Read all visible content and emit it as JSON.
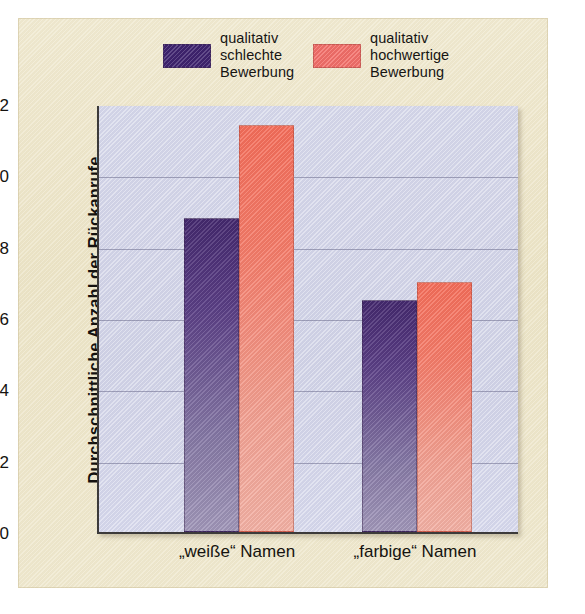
{
  "chart_data": {
    "type": "bar",
    "title": "",
    "xlabel": "",
    "ylabel": "Durchschnittliche Anzahl der Rückanrufe",
    "categories": [
      "„weiße“ Namen",
      "„farbige“ Namen"
    ],
    "series": [
      {
        "name": "qualitativ\nschlechte\nBewerbung",
        "color": "#4b3079",
        "values": [
          8.8,
          6.5
        ]
      },
      {
        "name": "qualitativ\nhochwertige\nBewerbung",
        "color": "#f4705c",
        "values": [
          11.4,
          7.0
        ]
      }
    ],
    "ylim": [
      0,
      12
    ],
    "yticks": [
      0,
      2,
      4,
      6,
      8,
      10,
      12
    ],
    "ytick_labels": [
      "0",
      "2",
      "4",
      "6",
      "8",
      "10",
      "12"
    ],
    "grid": true,
    "legend_position": "above-plot",
    "plot_background": "#d4d6e8",
    "figure_background": "#ece4c6"
  }
}
